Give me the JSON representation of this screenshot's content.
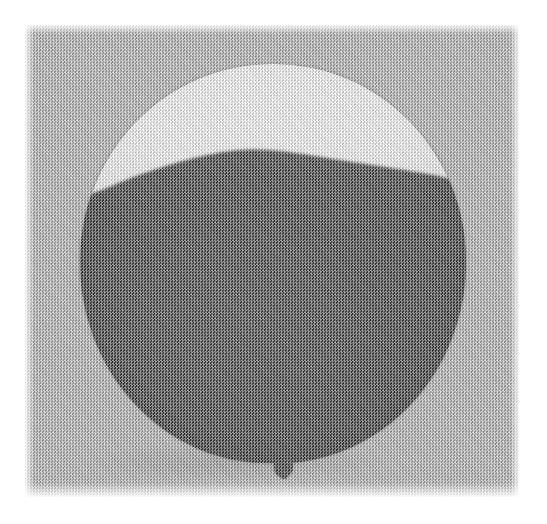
{
  "page": {
    "width": 547,
    "height": 524,
    "background_color": "#ffffff",
    "margin_px": 25,
    "caption": ""
  },
  "photo": {
    "title": "Dark balloon with white highlight cap",
    "media": "scanned halftone photograph",
    "kind": "natural-image",
    "plate": {
      "left": 25,
      "top": 25,
      "width": 494,
      "height": 472,
      "background_color": "#a8a8a8",
      "background_tone_label": "mid gray halftone"
    },
    "screen": {
      "pattern": "checkerboard dither",
      "cell_px": 3,
      "secondary_cell_px": 4,
      "grain": "fine diagonal"
    },
    "subject": {
      "name": "balloon",
      "shape": "sphere",
      "center_x": 272,
      "center_y": 263,
      "width": 386,
      "height": 399,
      "bounds": {
        "left": 80,
        "top": 64,
        "right": 466,
        "bottom": 463
      },
      "body_color": "#121212",
      "body_tone_label": "near black",
      "highlight": {
        "name": "specular highlight cap",
        "color": "#fdfdfd",
        "tone_label": "white",
        "boundary_note": "wavy crest: dips left, peaks at center, dips right",
        "boundary_points": [
          {
            "x": 84,
            "y": 196
          },
          {
            "x": 100,
            "y": 191
          },
          {
            "x": 130,
            "y": 178
          },
          {
            "x": 165,
            "y": 166
          },
          {
            "x": 200,
            "y": 156
          },
          {
            "x": 240,
            "y": 149
          },
          {
            "x": 275,
            "y": 150
          },
          {
            "x": 310,
            "y": 155
          },
          {
            "x": 345,
            "y": 161
          },
          {
            "x": 380,
            "y": 166
          },
          {
            "x": 410,
            "y": 171
          },
          {
            "x": 440,
            "y": 176
          },
          {
            "x": 462,
            "y": 183
          }
        ]
      },
      "knot": {
        "name": "balloon knot",
        "left": 274,
        "top": 460,
        "width": 19,
        "height": 17,
        "color": "#131313"
      }
    },
    "palette": {
      "paper_white": "#ffffff",
      "background_gray": "#a8a8a8",
      "highlight_white": "#fdfdfd",
      "body_black": "#121212",
      "shadow": "#000000"
    }
  }
}
